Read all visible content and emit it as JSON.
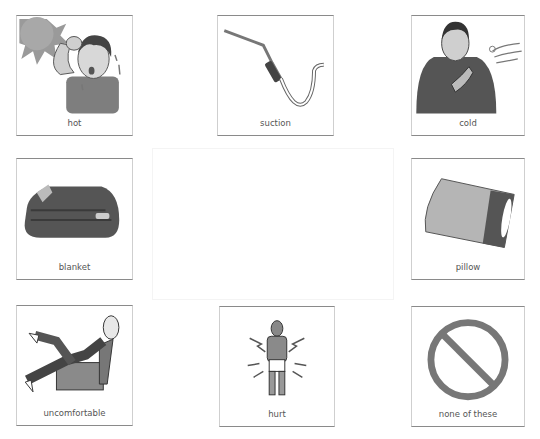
{
  "board": {
    "cards": [
      {
        "label": "hot",
        "icon": "hot-person-icon"
      },
      {
        "label": "suction",
        "icon": "suction-tube-icon"
      },
      {
        "label": "cold",
        "icon": "cold-person-icon"
      },
      {
        "label": "blanket",
        "icon": "blanket-icon"
      },
      {
        "label": "pillow",
        "icon": "pillow-icon"
      },
      {
        "label": "uncomfortable",
        "icon": "uncomfortable-person-icon"
      },
      {
        "label": "hurt",
        "icon": "hurt-person-icon"
      },
      {
        "label": "none of these",
        "icon": "prohibited-icon"
      }
    ]
  }
}
